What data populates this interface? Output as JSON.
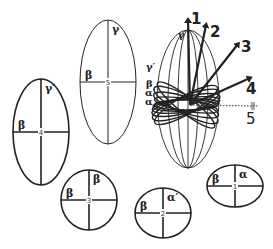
{
  "diagram": {
    "title": "",
    "stroke_color": "#222222",
    "background": "#ffffff",
    "ellipses": [
      {
        "id": "5",
        "cx": 108,
        "cy": 82,
        "rx": 28,
        "ry": 62,
        "stroke_width": 1,
        "axis_label_top": "γ",
        "axis_label_left": "β",
        "center_label": "5"
      },
      {
        "id": "4",
        "cx": 41,
        "cy": 132,
        "rx": 28,
        "ry": 53,
        "stroke_width": 1.6,
        "axis_label_top": "γ′",
        "axis_label_left": "β",
        "center_label": "4"
      },
      {
        "id": "3",
        "cx": 89,
        "cy": 200,
        "rx": 28,
        "ry": 30,
        "stroke_width": 1.6,
        "axis_label_top": "β",
        "axis_label_left": "β",
        "center_label": "3"
      },
      {
        "id": "2",
        "cx": 163,
        "cy": 213,
        "rx": 28,
        "ry": 25,
        "stroke_width": 1.6,
        "axis_label_top": "α′",
        "axis_label_left": "β",
        "center_label": "2"
      },
      {
        "id": "1",
        "cx": 235,
        "cy": 186,
        "rx": 28,
        "ry": 21,
        "stroke_width": 1.6,
        "axis_label_top": "α",
        "axis_label_left": "β",
        "center_label": "1"
      }
    ],
    "composite": {
      "origin": {
        "x": 190,
        "y": 105
      },
      "outer_ellipse": {
        "cx": 188,
        "cy": 99,
        "rx": 31,
        "ry": 69
      },
      "side_labels": [
        {
          "text": "γ′",
          "x": 146,
          "y": 70
        },
        {
          "text": "β",
          "x": 146,
          "y": 87
        },
        {
          "text": "α′",
          "x": 145,
          "y": 96
        },
        {
          "text": "α",
          "x": 145,
          "y": 105
        },
        {
          "text": "γ",
          "x": 178,
          "y": 38
        }
      ],
      "arrows": [
        {
          "label": "1",
          "x2": 188,
          "y2": 20,
          "label_x": 191,
          "label_y": 24,
          "style": "solid"
        },
        {
          "label": "2",
          "x2": 206,
          "y2": 25,
          "label_x": 210,
          "label_y": 37,
          "style": "solid"
        },
        {
          "label": "3",
          "x2": 238,
          "y2": 44,
          "label_x": 241,
          "label_y": 52,
          "style": "solid"
        },
        {
          "label": "4",
          "x2": 250,
          "y2": 78,
          "label_x": 246,
          "label_y": 94,
          "style": "solid"
        },
        {
          "label": "5",
          "x2": 258,
          "y2": 106,
          "label_x": 246,
          "label_y": 124,
          "style": "dotted"
        }
      ]
    }
  }
}
